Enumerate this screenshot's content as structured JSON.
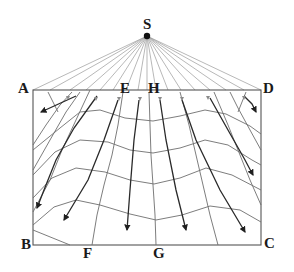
{
  "diagram": {
    "title": "",
    "labels": {
      "S": "S",
      "A": "A",
      "B": "B",
      "C": "C",
      "D": "D",
      "E": "E",
      "F": "F",
      "G": "G",
      "H": "H"
    },
    "points": {
      "S": [
        147,
        36
      ],
      "A": [
        33,
        90
      ],
      "B": [
        33,
        245
      ],
      "C": [
        261,
        245
      ],
      "D": [
        261,
        90
      ],
      "E": [
        126,
        90
      ],
      "H": [
        154,
        90
      ],
      "F": [
        88,
        245
      ],
      "G": [
        157,
        245
      ]
    }
  }
}
